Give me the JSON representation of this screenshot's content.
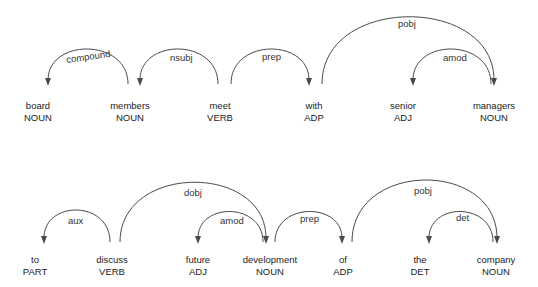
{
  "diagram_type": "dependency-parse",
  "rows": [
    {
      "tokens": [
        {
          "text": "board",
          "tag": "NOUN",
          "x": 38
        },
        {
          "text": "members",
          "tag": "NOUN",
          "x": 130
        },
        {
          "text": "meet",
          "tag": "VERB",
          "x": 220
        },
        {
          "text": "with",
          "tag": "ADP",
          "x": 310
        },
        {
          "text": "senior",
          "tag": "ADJ",
          "x": 403
        },
        {
          "text": "managers",
          "tag": "NOUN",
          "x": 493
        }
      ],
      "arcs": [
        {
          "label": "compound",
          "from": 1,
          "to": 0
        },
        {
          "label": "nsubj",
          "from": 2,
          "to": 1
        },
        {
          "label": "prep",
          "from": 2,
          "to": 3
        },
        {
          "label": "pobj",
          "from": 3,
          "to": 5
        },
        {
          "label": "amod",
          "from": 5,
          "to": 4
        }
      ]
    },
    {
      "tokens": [
        {
          "text": "to",
          "tag": "PART",
          "x": 35
        },
        {
          "text": "discuss",
          "tag": "VERB",
          "x": 112
        },
        {
          "text": "future",
          "tag": "ADJ",
          "x": 198
        },
        {
          "text": "development",
          "tag": "NOUN",
          "x": 268
        },
        {
          "text": "of",
          "tag": "ADP",
          "x": 343
        },
        {
          "text": "the",
          "tag": "DET",
          "x": 420
        },
        {
          "text": "company",
          "tag": "NOUN",
          "x": 496
        }
      ],
      "arcs": [
        {
          "label": "aux",
          "from": 1,
          "to": 0
        },
        {
          "label": "dobj",
          "from": 1,
          "to": 3
        },
        {
          "label": "amod",
          "from": 3,
          "to": 2
        },
        {
          "label": "prep",
          "from": 3,
          "to": 4
        },
        {
          "label": "pobj",
          "from": 4,
          "to": 6
        },
        {
          "label": "det",
          "from": 6,
          "to": 5
        }
      ]
    }
  ]
}
